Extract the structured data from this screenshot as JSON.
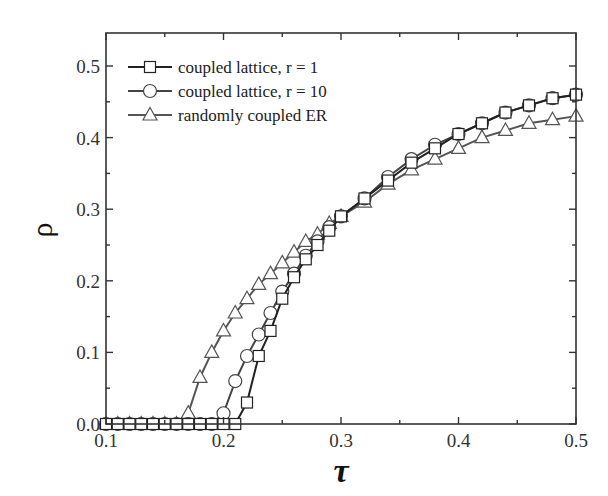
{
  "chart_data": {
    "type": "line",
    "title": "",
    "xlabel": "τ",
    "ylabel": "ρ",
    "xlim": [
      0.1,
      0.5
    ],
    "ylim": [
      0.0,
      0.55
    ],
    "xticks": [
      0.1,
      0.2,
      0.3,
      0.4,
      0.5
    ],
    "xtick_labels": [
      "0.1",
      "0.2",
      "0.3",
      "0.4",
      "0.5"
    ],
    "yticks": [
      0.0,
      0.1,
      0.2,
      0.3,
      0.4,
      0.5
    ],
    "ytick_labels": [
      "0.0",
      "0.1",
      "0.2",
      "0.3",
      "0.4",
      "0.5"
    ],
    "grid": false,
    "legend_position": "upper left",
    "series": [
      {
        "name": "coupled lattice, r = 1",
        "marker": "square",
        "color": "#222222",
        "x": [
          0.1,
          0.11,
          0.12,
          0.13,
          0.14,
          0.15,
          0.16,
          0.17,
          0.18,
          0.19,
          0.2,
          0.21,
          0.22,
          0.23,
          0.24,
          0.25,
          0.26,
          0.27,
          0.28,
          0.29,
          0.3,
          0.32,
          0.34,
          0.36,
          0.38,
          0.4,
          0.42,
          0.44,
          0.46,
          0.48,
          0.5
        ],
        "values": [
          0,
          0,
          0,
          0,
          0,
          0,
          0,
          0,
          0,
          0,
          0,
          0,
          0.03,
          0.095,
          0.13,
          0.175,
          0.205,
          0.23,
          0.25,
          0.27,
          0.29,
          0.315,
          0.34,
          0.365,
          0.385,
          0.405,
          0.42,
          0.435,
          0.445,
          0.455,
          0.46
        ]
      },
      {
        "name": "coupled lattice, r = 10",
        "marker": "circle",
        "color": "#444444",
        "x": [
          0.1,
          0.11,
          0.12,
          0.13,
          0.14,
          0.15,
          0.16,
          0.17,
          0.18,
          0.19,
          0.2,
          0.21,
          0.22,
          0.23,
          0.24,
          0.25,
          0.26,
          0.27,
          0.28,
          0.29,
          0.3,
          0.32,
          0.34,
          0.36,
          0.38,
          0.4,
          0.42,
          0.44,
          0.46,
          0.48,
          0.5
        ],
        "values": [
          0,
          0,
          0,
          0,
          0,
          0,
          0,
          0,
          0,
          0,
          0.015,
          0.06,
          0.095,
          0.125,
          0.155,
          0.185,
          0.21,
          0.235,
          0.255,
          0.275,
          0.29,
          0.315,
          0.345,
          0.37,
          0.39,
          0.405,
          0.42,
          0.435,
          0.445,
          0.455,
          0.46
        ]
      },
      {
        "name": "randomly coupled ER",
        "marker": "triangle",
        "color": "#555555",
        "x": [
          0.1,
          0.11,
          0.12,
          0.13,
          0.14,
          0.15,
          0.16,
          0.17,
          0.18,
          0.19,
          0.2,
          0.21,
          0.22,
          0.23,
          0.24,
          0.25,
          0.26,
          0.27,
          0.28,
          0.29,
          0.3,
          0.32,
          0.34,
          0.36,
          0.38,
          0.4,
          0.42,
          0.44,
          0.46,
          0.48,
          0.5
        ],
        "values": [
          0,
          0,
          0,
          0,
          0,
          0,
          0,
          0.015,
          0.065,
          0.1,
          0.13,
          0.155,
          0.175,
          0.195,
          0.21,
          0.225,
          0.24,
          0.255,
          0.265,
          0.28,
          0.29,
          0.31,
          0.335,
          0.355,
          0.37,
          0.385,
          0.4,
          0.41,
          0.42,
          0.425,
          0.43
        ]
      }
    ]
  },
  "legend": {
    "items": [
      {
        "label": "coupled lattice, r = 1",
        "marker": "square"
      },
      {
        "label": "coupled lattice, r = 10",
        "marker": "circle"
      },
      {
        "label": "randomly coupled ER",
        "marker": "triangle"
      }
    ]
  },
  "axes": {
    "x_title": "τ",
    "y_title": "ρ"
  }
}
